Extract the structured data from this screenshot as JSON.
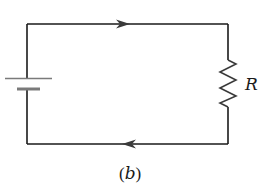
{
  "diagram": {
    "type": "circuit",
    "components": [
      {
        "kind": "battery",
        "position": "left"
      },
      {
        "kind": "resistor",
        "position": "right",
        "label": "R"
      }
    ],
    "current_arrows": [
      {
        "wire": "top",
        "direction": "right"
      },
      {
        "wire": "bottom",
        "direction": "left"
      }
    ],
    "resistor_label": "R",
    "caption_open": "(",
    "caption_letter": "b",
    "caption_close": ")",
    "colors": {
      "wire": "#1a1a1a",
      "battery_plate": "#7a7a7a",
      "resistor": "#3a3a3a"
    }
  }
}
